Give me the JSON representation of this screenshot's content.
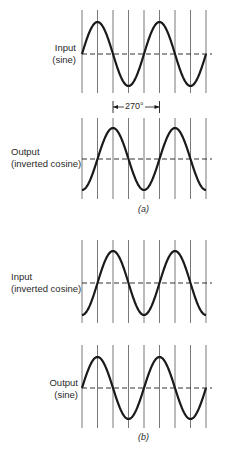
{
  "figure": {
    "panels": [
      {
        "id": "a",
        "caption": "(a)",
        "plots": [
          {
            "role": "input",
            "label_line1": "Input",
            "label_line2": "(sine)",
            "waveform": "sine",
            "cycles": 2
          },
          {
            "role": "output",
            "label_line1": "Output",
            "label_line2": "(inverted cosine)",
            "waveform": "inverted-cosine",
            "cycles": 2
          }
        ],
        "annotation": {
          "text": "270°",
          "from_gridline": 2,
          "to_gridline": 5
        }
      },
      {
        "id": "b",
        "caption": "(b)",
        "plots": [
          {
            "role": "input",
            "label_line1": "Input",
            "label_line2": "(inverted cosine)",
            "waveform": "inverted-cosine",
            "cycles": 2
          },
          {
            "role": "output",
            "label_line1": "Output",
            "label_line2": "(sine)",
            "waveform": "sine",
            "cycles": 2
          }
        ]
      }
    ],
    "grid": {
      "vertical_lines": 9,
      "degrees_per_division": 90
    },
    "colors": {
      "ink": "#1a1a1a",
      "grid": "#555555",
      "background": "#ffffff"
    }
  }
}
